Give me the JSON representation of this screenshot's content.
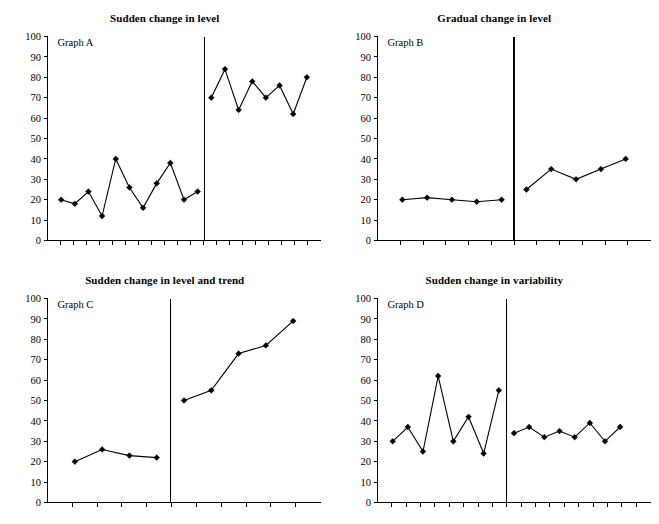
{
  "figure": {
    "background": "#ffffff",
    "ink": "#000000"
  },
  "chart_data": [
    {
      "type": "line",
      "panel": "A",
      "title": "Sudden change in level",
      "inline_label": "Graph A",
      "xlabel": "",
      "ylabel": "",
      "ylim": [
        0,
        100
      ],
      "yticks": [
        0,
        10,
        20,
        30,
        40,
        50,
        60,
        70,
        80,
        90,
        100
      ],
      "grid": false,
      "legend": "none",
      "xlim": [
        0,
        20
      ],
      "xticks_count": 20,
      "phase_line_x": 11.5,
      "series": [
        {
          "name": "Baseline",
          "x": [
            1,
            2,
            3,
            4,
            5,
            6,
            7,
            8,
            9,
            10,
            11
          ],
          "values": [
            20,
            18,
            24,
            12,
            40,
            26,
            16,
            28,
            38,
            20,
            24
          ]
        },
        {
          "name": "Intervention",
          "x": [
            12,
            13,
            14,
            15,
            16,
            17,
            18,
            19
          ],
          "values": [
            70,
            84,
            64,
            78,
            70,
            76,
            62,
            80
          ]
        }
      ]
    },
    {
      "type": "line",
      "panel": "B",
      "title": "Gradual change in level",
      "inline_label": "Graph B",
      "xlabel": "",
      "ylabel": "",
      "ylim": [
        0,
        100
      ],
      "yticks": [
        0,
        10,
        20,
        30,
        40,
        50,
        60,
        70,
        80,
        90,
        100
      ],
      "grid": false,
      "legend": "none",
      "xlim": [
        0,
        11
      ],
      "xticks_count": 11,
      "phase_line_x": 5.5,
      "series": [
        {
          "name": "Baseline",
          "x": [
            1,
            2,
            3,
            4,
            5
          ],
          "values": [
            20,
            21,
            20,
            19,
            20
          ]
        },
        {
          "name": "Intervention",
          "x": [
            6,
            7,
            8,
            9,
            10
          ],
          "values": [
            25,
            35,
            30,
            35,
            40
          ]
        }
      ]
    },
    {
      "type": "line",
      "panel": "C",
      "title": "Sudden change in level and trend",
      "inline_label": "Graph C",
      "xlabel": "",
      "ylabel": "",
      "ylim": [
        0,
        100
      ],
      "yticks": [
        0,
        10,
        20,
        30,
        40,
        50,
        60,
        70,
        80,
        90,
        100
      ],
      "grid": false,
      "legend": "none",
      "xlim": [
        0,
        10
      ],
      "xticks_count": 10,
      "phase_line_x": 4.5,
      "series": [
        {
          "name": "Baseline",
          "x": [
            1,
            2,
            3,
            4
          ],
          "values": [
            20,
            26,
            23,
            22
          ]
        },
        {
          "name": "Intervention",
          "x": [
            5,
            6,
            7,
            8,
            9
          ],
          "values": [
            50,
            55,
            73,
            77,
            89
          ]
        }
      ]
    },
    {
      "type": "line",
      "panel": "D",
      "title": "Sudden change in variability",
      "inline_label": "Graph D",
      "xlabel": "",
      "ylabel": "",
      "ylim": [
        0,
        100
      ],
      "yticks": [
        0,
        10,
        20,
        30,
        40,
        50,
        60,
        70,
        80,
        90,
        100
      ],
      "grid": false,
      "legend": "none",
      "xlim": [
        0,
        18
      ],
      "xticks_count": 18,
      "phase_line_x": 8.5,
      "series": [
        {
          "name": "Baseline",
          "x": [
            1,
            2,
            3,
            4,
            5,
            6,
            7,
            8
          ],
          "values": [
            30,
            37,
            25,
            62,
            30,
            42,
            24,
            55
          ]
        },
        {
          "name": "Intervention",
          "x": [
            9,
            10,
            11,
            12,
            13,
            14,
            15,
            16
          ],
          "values": [
            34,
            37,
            32,
            35,
            32,
            39,
            30,
            37
          ]
        }
      ]
    }
  ]
}
